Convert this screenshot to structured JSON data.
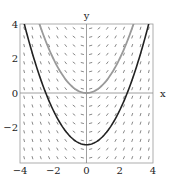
{
  "chart_data": {
    "type": "line",
    "title": "",
    "xlabel": "x",
    "ylabel": "y",
    "xlim": [
      -4,
      4
    ],
    "ylim": [
      -4,
      4
    ],
    "x_ticks": [
      -4,
      -2,
      0,
      2,
      4
    ],
    "y_ticks": [
      -2,
      0,
      2,
      4
    ],
    "x_tick_labels": [
      "−4",
      "−2",
      "0",
      "2",
      "4"
    ],
    "y_tick_labels": [
      "−2",
      "0",
      "2",
      "4"
    ],
    "grid": false,
    "background": "slope field (short dashes)",
    "series": [
      {
        "name": "solution curve (gray)",
        "formula": "y = x^2/2",
        "color": "#9a9a9a",
        "x": [
          -2.83,
          -2,
          -1,
          0,
          1,
          2,
          2.83
        ],
        "y": [
          4,
          2,
          0.5,
          0,
          0.5,
          2,
          4
        ]
      },
      {
        "name": "solution curve (black)",
        "formula": "y = x^2/2 - 3",
        "color": "#222222",
        "x": [
          -3.74,
          -3,
          -2.45,
          -2,
          -1,
          0,
          1,
          2,
          2.45,
          3,
          3.74
        ],
        "y": [
          4,
          1.5,
          0,
          -1,
          -2.5,
          -3,
          -2.5,
          -1,
          0,
          1.5,
          4
        ]
      }
    ]
  }
}
